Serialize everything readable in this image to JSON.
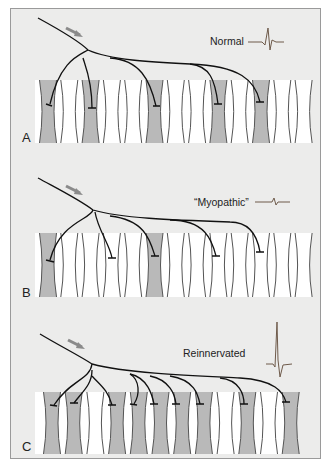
{
  "figure": {
    "panels": [
      {
        "id": "A",
        "letter": "A",
        "label": "Normal",
        "waveform": "normal-small-triphasic",
        "shaded_fibers": [
          0,
          2,
          5,
          8,
          10
        ],
        "fiber_count": 13
      },
      {
        "id": "B",
        "letter": "B",
        "label": "“Myopathic”",
        "waveform": "small-short",
        "shaded_fibers": [
          0,
          5
        ],
        "fiber_count": 13
      },
      {
        "id": "C",
        "letter": "C",
        "label": "Reinnervated",
        "waveform": "large-polyphasic",
        "shaded_fibers": [
          0,
          1,
          3,
          4,
          5,
          6,
          7,
          9,
          11
        ],
        "fiber_count": 12
      }
    ],
    "colors": {
      "background": "#ececeb",
      "fiber_fill": "#b9b9b9",
      "fiber_line": "#555555",
      "axon": "#111111",
      "arrow": "#8a8a8a",
      "waveform": "#6e5a4a"
    }
  }
}
